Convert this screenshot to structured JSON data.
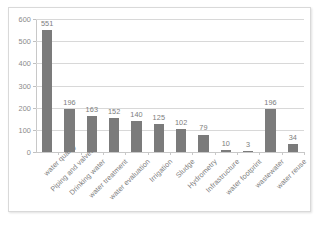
{
  "chart_data": {
    "type": "bar",
    "title": "",
    "subtitle": "",
    "xlabel": "",
    "ylabel": "",
    "ylim": [
      0,
      600
    ],
    "yticks": [
      0,
      100,
      200,
      300,
      400,
      500,
      600
    ],
    "ytick_labels": [
      "0",
      "100",
      "200",
      "300",
      "400",
      "500",
      "600"
    ],
    "grid": true,
    "legend": false,
    "bar_color": "#7b7b7b",
    "gridline_color": "#d8d8d8",
    "label_color": "#7d7d7d",
    "categories": [
      "water quality",
      "Piping and valves",
      "Drinking water",
      "water treatment",
      "water evaluation",
      "Irrigation",
      "Sludge",
      "Hydrometry",
      "Infrastructure",
      "water footprint",
      "wastewater",
      "water reuse"
    ],
    "values": [
      551,
      196,
      163,
      152,
      140,
      125,
      102,
      79,
      10,
      3,
      196,
      34
    ],
    "value_labels": [
      "551",
      "196",
      "163",
      "152",
      "140",
      "125",
      "102",
      "79",
      "10",
      "3",
      "196",
      "34"
    ]
  }
}
